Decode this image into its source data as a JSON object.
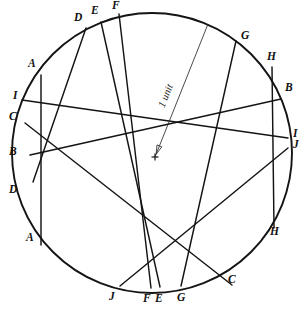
{
  "figure": {
    "background_color": "#ffffff",
    "line_color": "#141414",
    "circle": {
      "cx": 152,
      "cy": 153,
      "r": 140
    },
    "center_marker": {
      "x": 155,
      "y": 157,
      "glyph": "plus-mark"
    },
    "radius_annotation": {
      "label": "1 unit",
      "from_x": 155,
      "from_y": 157,
      "to_x": 208,
      "to_y": 24,
      "label_x": 166,
      "label_y": 98,
      "rotation_deg": -68
    },
    "chords": [
      {
        "id": "A",
        "label": "A",
        "x1": 41,
        "y1": 75,
        "x2": 41,
        "y2": 245
      },
      {
        "id": "B",
        "label": "B",
        "x1": 30,
        "y1": 155,
        "x2": 281,
        "y2": 99
      },
      {
        "id": "C",
        "label": "C",
        "x1": 25,
        "y1": 123,
        "x2": 232,
        "y2": 285
      },
      {
        "id": "D",
        "label": "D",
        "x1": 86,
        "y1": 28,
        "x2": 33,
        "y2": 182
      },
      {
        "id": "E",
        "label": "E",
        "x1": 101,
        "y1": 22,
        "x2": 160,
        "y2": 287
      },
      {
        "id": "F",
        "label": "F",
        "x1": 119,
        "y1": 14,
        "x2": 151,
        "y2": 288
      },
      {
        "id": "G",
        "label": "G",
        "x1": 236,
        "y1": 41,
        "x2": 181,
        "y2": 286
      },
      {
        "id": "H",
        "label": "H",
        "x1": 272,
        "y1": 67,
        "x2": 274,
        "y2": 228
      },
      {
        "id": "I",
        "label": "I",
        "x1": 22,
        "y1": 100,
        "x2": 288,
        "y2": 138
      },
      {
        "id": "J",
        "label": "J",
        "x1": 120,
        "y1": 286,
        "x2": 288,
        "y2": 148
      }
    ],
    "labels": [
      {
        "text": "D",
        "x": 74,
        "y": 12,
        "name": "label-d-top"
      },
      {
        "text": "E",
        "x": 91,
        "y": 5,
        "name": "label-e-top"
      },
      {
        "text": "F",
        "x": 112,
        "y": 0,
        "name": "label-f-top"
      },
      {
        "text": "G",
        "x": 241,
        "y": 30,
        "name": "label-g-top"
      },
      {
        "text": "A",
        "x": 28,
        "y": 58,
        "name": "label-a-upper-left"
      },
      {
        "text": "H",
        "x": 267,
        "y": 51,
        "name": "label-h-upper-right"
      },
      {
        "text": "I",
        "x": 13,
        "y": 90,
        "name": "label-i-left"
      },
      {
        "text": "B",
        "x": 285,
        "y": 82,
        "name": "label-b-right"
      },
      {
        "text": "C",
        "x": 9,
        "y": 111,
        "name": "label-c-left"
      },
      {
        "text": "B",
        "x": 9,
        "y": 146,
        "name": "label-b-left"
      },
      {
        "text": "I",
        "x": 293,
        "y": 128,
        "name": "label-i-right"
      },
      {
        "text": "J",
        "x": 293,
        "y": 139,
        "name": "label-j-right"
      },
      {
        "text": "D",
        "x": 9,
        "y": 184,
        "name": "label-d-lower-left"
      },
      {
        "text": "A",
        "x": 26,
        "y": 232,
        "name": "label-a-lower-left"
      },
      {
        "text": "H",
        "x": 270,
        "y": 226,
        "name": "label-h-lower-right"
      },
      {
        "text": "C",
        "x": 228,
        "y": 274,
        "name": "label-c-lower-right"
      },
      {
        "text": "J",
        "x": 109,
        "y": 291,
        "name": "label-j-bottom"
      },
      {
        "text": "F",
        "x": 143,
        "y": 293,
        "name": "label-f-bottom"
      },
      {
        "text": "E",
        "x": 155,
        "y": 293,
        "name": "label-e-bottom"
      },
      {
        "text": "G",
        "x": 177,
        "y": 292,
        "name": "label-g-bottom"
      }
    ]
  }
}
